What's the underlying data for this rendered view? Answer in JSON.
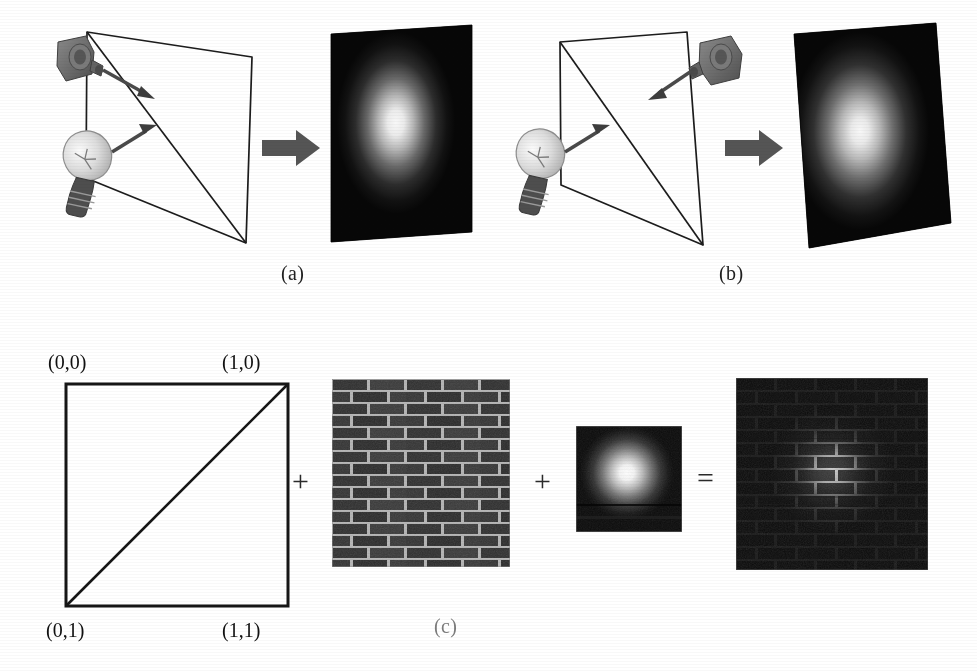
{
  "figure": {
    "kind": "textbook-figure",
    "background_color": "#ffffff",
    "ink_color": "#1a1a1a"
  },
  "panels": {
    "a": {
      "caption": "(a)",
      "icons": {
        "camera": "camera-icon",
        "light": "lightbulb-icon",
        "transform_arrow": "block-arrow-right-icon"
      },
      "camera_position": "upper-left",
      "light_position": "lower-left",
      "arrow_from_camera": "view-direction-arrow",
      "arrow_from_light": "light-direction-arrow",
      "geometry": "quad-with-diagonal-wireframe",
      "render": "lit-quad-render"
    },
    "b": {
      "caption": "(b)",
      "icons": {
        "camera": "camera-icon",
        "light": "lightbulb-icon",
        "transform_arrow": "block-arrow-right-icon"
      },
      "camera_position": "upper-right",
      "light_position": "lower-left",
      "arrow_from_camera": "view-direction-arrow",
      "arrow_from_light": "light-direction-arrow",
      "geometry": "quad-with-diagonal-wireframe",
      "render": "lit-quad-render"
    },
    "c": {
      "caption": "(c)",
      "uv_square": {
        "name": "uv-parameter-square",
        "corners": {
          "top_left": "(0,0)",
          "top_right": "(1,0)",
          "bottom_left": "(0,1)",
          "bottom_right": "(1,1)"
        },
        "diagonal": "triangle-split-diagonal"
      },
      "operators": {
        "plus_one": "+",
        "plus_two": "+",
        "equals": "="
      },
      "textures": {
        "brick": {
          "name": "brick-wall-texture",
          "description": "dark brick wall with light mortar",
          "brick_color": "#3a3a3a",
          "mortar_color": "#b9b9b9",
          "rows": 15,
          "columns": 5
        },
        "lightmap": {
          "name": "lightmap-texture",
          "description": "radial white glow on dark square",
          "highlight_color": "#ffffff",
          "base_color": "#0d0d0d"
        },
        "result": {
          "name": "modulated-result-texture",
          "description": "brick wall modulated by lightmap",
          "base_color": "#070707",
          "highlight_color": "#cfcfcf"
        }
      }
    }
  },
  "colors": {
    "paper": "#ffffff",
    "line": "#1a1a1a",
    "arrow_gray": "#555555",
    "camera_gray": "#6f6f6f",
    "bulb_glass": "#e3e3e3",
    "bulb_base": "#4a4a4a",
    "render_dark": "#080808",
    "render_glow": "#ffffff"
  }
}
